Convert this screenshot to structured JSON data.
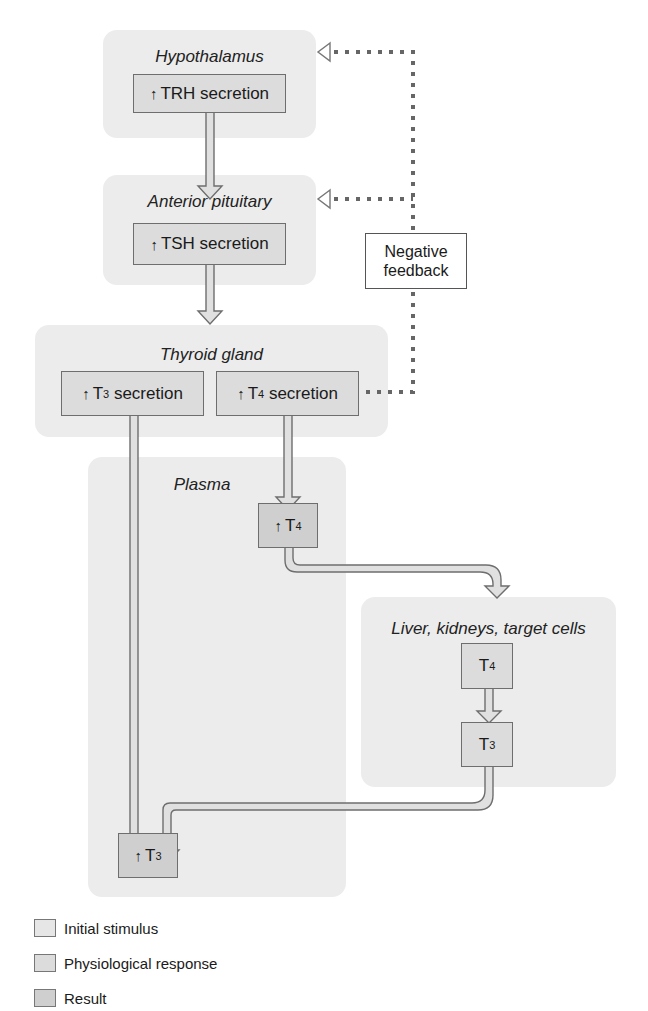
{
  "diagram": {
    "regions": {
      "hypothalamus": "Hypothalamus",
      "anterior_pituitary": "Anterior pituitary",
      "thyroid_gland": "Thyroid gland",
      "plasma": "Plasma",
      "liver": "Liver, kidneys, target cells"
    },
    "boxes": {
      "trh": {
        "arrow": "↑",
        "label": "TRH secretion"
      },
      "tsh": {
        "arrow": "↑",
        "label": "TSH secretion"
      },
      "t3_secretion": {
        "arrow": "↑",
        "hormone": "T",
        "sub": "3",
        "label": "secretion"
      },
      "t4_secretion": {
        "arrow": "↑",
        "hormone": "T",
        "sub": "4",
        "label": "secretion"
      },
      "plasma_t4": {
        "arrow": "↑",
        "hormone": "T",
        "sub": "4"
      },
      "liver_t4": {
        "hormone": "T",
        "sub": "4"
      },
      "liver_t3": {
        "hormone": "T",
        "sub": "3"
      },
      "plasma_t3": {
        "arrow": "↑",
        "hormone": "T",
        "sub": "3"
      }
    },
    "negative_feedback": {
      "line1": "Negative",
      "line2": "feedback"
    }
  },
  "legend": {
    "items": [
      {
        "label": "Initial stimulus",
        "color": "#e6e6e6"
      },
      {
        "label": "Physiological response",
        "color": "#dcdcdc"
      },
      {
        "label": "Result",
        "color": "#cfcfcf"
      }
    ]
  },
  "colors": {
    "region_bg": "#ececec",
    "box_bg": "#dcdcdc",
    "result_bg": "#cfcfcf",
    "border": "#6e6e6e",
    "feedback_dots": "#666666"
  }
}
